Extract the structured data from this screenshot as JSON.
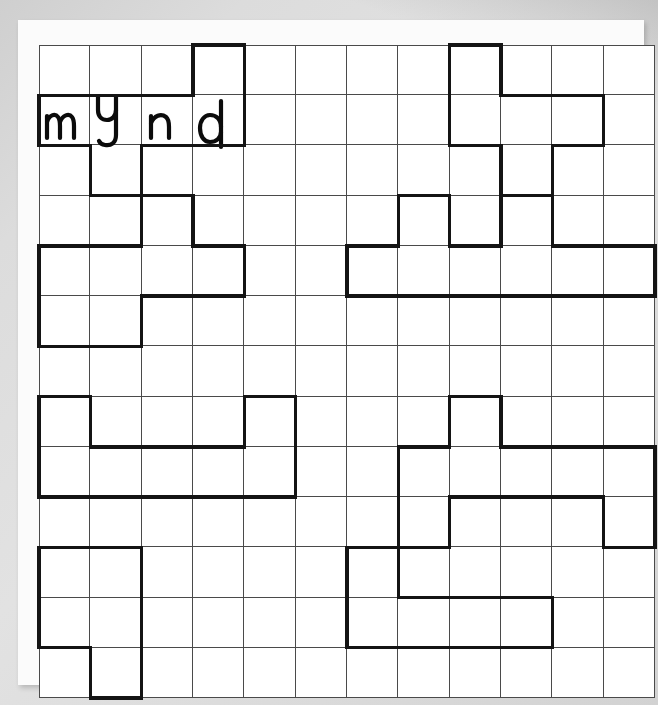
{
  "puzzle": {
    "type": "word-shape-grid-worksheet",
    "grid": {
      "columns": 12,
      "rows": 13
    },
    "filled_word": {
      "text": "mynd",
      "letters": [
        "m",
        "y",
        "n",
        "d"
      ]
    },
    "letter_cells": [
      {
        "letter": "m",
        "row": 1,
        "col": 0
      },
      {
        "letter": "y",
        "row": 1,
        "col": 1
      },
      {
        "letter": "n",
        "row": 1,
        "col": 2
      },
      {
        "letter": "d",
        "row": 1,
        "col": 3
      }
    ],
    "shapes": [
      {
        "name": "shape-mynd",
        "cells": [
          [
            0,
            3
          ],
          [
            1,
            0
          ],
          [
            1,
            1
          ],
          [
            1,
            2
          ],
          [
            1,
            3
          ],
          [
            2,
            1
          ]
        ]
      },
      {
        "name": "shape-top-right",
        "cells": [
          [
            0,
            8
          ],
          [
            1,
            8
          ],
          [
            1,
            9
          ],
          [
            1,
            10
          ],
          [
            2,
            9
          ]
        ]
      },
      {
        "name": "shape-upper-left",
        "cells": [
          [
            3,
            2
          ],
          [
            4,
            0
          ],
          [
            4,
            1
          ],
          [
            4,
            2
          ],
          [
            4,
            3
          ],
          [
            5,
            0
          ],
          [
            5,
            1
          ]
        ]
      },
      {
        "name": "shape-upper-right",
        "cells": [
          [
            3,
            7
          ],
          [
            3,
            9
          ],
          [
            4,
            6
          ],
          [
            4,
            7
          ],
          [
            4,
            8
          ],
          [
            4,
            9
          ],
          [
            4,
            10
          ],
          [
            4,
            11
          ]
        ]
      },
      {
        "name": "shape-middle-left",
        "cells": [
          [
            7,
            0
          ],
          [
            7,
            4
          ],
          [
            8,
            0
          ],
          [
            8,
            1
          ],
          [
            8,
            2
          ],
          [
            8,
            3
          ],
          [
            8,
            4
          ]
        ]
      },
      {
        "name": "shape-middle-right",
        "cells": [
          [
            7,
            8
          ],
          [
            8,
            7
          ],
          [
            8,
            8
          ],
          [
            8,
            9
          ],
          [
            8,
            10
          ],
          [
            8,
            11
          ],
          [
            9,
            7
          ],
          [
            9,
            11
          ]
        ]
      },
      {
        "name": "shape-bottom-left",
        "cells": [
          [
            10,
            0
          ],
          [
            10,
            1
          ],
          [
            11,
            0
          ],
          [
            11,
            1
          ],
          [
            12,
            1
          ]
        ]
      },
      {
        "name": "shape-bottom-middle",
        "cells": [
          [
            10,
            6
          ],
          [
            11,
            6
          ],
          [
            11,
            7
          ],
          [
            11,
            8
          ],
          [
            11,
            9
          ]
        ]
      }
    ]
  },
  "colors": {
    "page_background": "#d8d8d8",
    "sheet": "#fbfbfb",
    "grid_line": "#4a4a4a",
    "shape_outline": "#141414",
    "ink": "#0b0b0b"
  }
}
